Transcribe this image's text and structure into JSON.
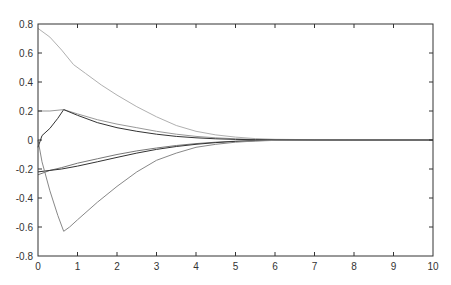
{
  "chart_data": {
    "type": "line",
    "title": "",
    "xlabel": "",
    "ylabel": "",
    "xlim": [
      0,
      10
    ],
    "ylim": [
      -0.8,
      0.8
    ],
    "grid": false,
    "legend": null,
    "x_ticks": [
      "0",
      "1",
      "2",
      "3",
      "4",
      "5",
      "6",
      "7",
      "8",
      "9",
      "10"
    ],
    "y_ticks": [
      "0.8",
      "0.6",
      "0.4",
      "0.2",
      "0",
      "-0.2",
      "-0.4",
      "-0.6",
      "-0.8"
    ],
    "series": [
      {
        "name": "s1",
        "color": "#b0b0b0",
        "x": [
          0,
          0.3,
          0.6,
          0.9,
          1.2,
          1.6,
          2,
          2.5,
          3,
          3.5,
          4,
          4.5,
          5,
          5.5,
          6,
          7,
          8,
          9,
          10
        ],
        "y": [
          0.77,
          0.71,
          0.62,
          0.52,
          0.46,
          0.38,
          0.31,
          0.23,
          0.16,
          0.1,
          0.06,
          0.035,
          0.02,
          0.01,
          0.005,
          0.002,
          0,
          0,
          0
        ]
      },
      {
        "name": "s2",
        "color": "#999999",
        "x": [
          0,
          0.05,
          0.3,
          0.65,
          1,
          1.5,
          2,
          2.5,
          3,
          3.5,
          4,
          4.5,
          5,
          5.5,
          6,
          7,
          8,
          9,
          10
        ],
        "y": [
          0.2,
          0.2,
          0.2,
          0.21,
          0.18,
          0.14,
          0.11,
          0.085,
          0.06,
          0.04,
          0.025,
          0.015,
          0.008,
          0.004,
          0.002,
          0.001,
          0,
          0,
          0
        ]
      },
      {
        "name": "s3",
        "color": "#333333",
        "x": [
          0,
          0.1,
          0.3,
          0.5,
          0.65,
          1,
          1.5,
          2,
          2.5,
          3,
          3.5,
          4,
          4.5,
          5,
          5.5,
          6,
          7,
          8,
          9,
          10
        ],
        "y": [
          -0.05,
          0.03,
          0.08,
          0.15,
          0.21,
          0.17,
          0.12,
          0.085,
          0.06,
          0.04,
          0.025,
          0.015,
          0.008,
          0.004,
          0.002,
          0.001,
          0,
          0,
          0,
          0
        ]
      },
      {
        "name": "s4",
        "color": "#777777",
        "x": [
          0,
          0.3,
          0.6,
          1,
          1.5,
          2,
          2.5,
          3,
          3.5,
          4,
          4.5,
          5,
          5.5,
          6,
          7,
          8,
          9,
          10
        ],
        "y": [
          -0.24,
          -0.21,
          -0.19,
          -0.16,
          -0.13,
          -0.1,
          -0.075,
          -0.055,
          -0.038,
          -0.025,
          -0.015,
          -0.008,
          -0.004,
          -0.002,
          -0.001,
          0,
          0,
          0
        ]
      },
      {
        "name": "s5",
        "color": "#333333",
        "x": [
          0,
          0.3,
          0.6,
          1,
          1.5,
          2,
          2.5,
          3,
          3.5,
          4,
          4.5,
          5,
          5.5,
          6,
          7,
          8,
          9,
          10
        ],
        "y": [
          -0.22,
          -0.21,
          -0.2,
          -0.18,
          -0.15,
          -0.12,
          -0.09,
          -0.065,
          -0.045,
          -0.03,
          -0.018,
          -0.01,
          -0.005,
          -0.002,
          -0.001,
          0,
          0,
          0
        ]
      },
      {
        "name": "s6",
        "color": "#888888",
        "x": [
          0,
          0.1,
          0.3,
          0.5,
          0.65,
          0.8,
          1,
          1.5,
          2,
          2.5,
          3,
          3.5,
          4,
          4.5,
          5,
          5.5,
          6,
          7,
          8,
          9,
          10
        ],
        "y": [
          0,
          -0.15,
          -0.35,
          -0.52,
          -0.63,
          -0.6,
          -0.55,
          -0.43,
          -0.32,
          -0.22,
          -0.14,
          -0.09,
          -0.05,
          -0.03,
          -0.015,
          -0.007,
          -0.003,
          -0.001,
          0,
          0,
          0
        ]
      }
    ]
  }
}
